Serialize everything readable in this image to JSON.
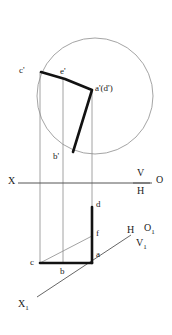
{
  "drawing": {
    "title": "Descriptive geometry projection",
    "colors": {
      "thick_line": "#121212",
      "thin_line": "#8c8c8c",
      "circle": "#9a9a9a",
      "axis": "#555555",
      "text": "#1a1a1a",
      "background": "#ffffff"
    },
    "circle": {
      "cx": 95,
      "cy": 96,
      "r": 58
    },
    "ground_line": {
      "y": 183,
      "x_start": 18,
      "x_end": 152
    },
    "front_view": {
      "polyline": "c'-e'-a'(d')-b'",
      "vertices": [
        {
          "name": "c-prime",
          "x": 41,
          "y": 72
        },
        {
          "name": "e-prime",
          "x": 65,
          "y": 79
        },
        {
          "name": "a-prime-d-prime",
          "x": 92,
          "y": 90
        },
        {
          "name": "b-prime",
          "x": 73,
          "y": 152
        }
      ]
    },
    "top_view": {
      "vertices": [
        {
          "name": "c",
          "x": 40,
          "y": 263
        },
        {
          "name": "b",
          "x": 63,
          "y": 263
        },
        {
          "name": "a",
          "x": 92,
          "y": 263
        },
        {
          "name": "f",
          "x": 92,
          "y": 236
        },
        {
          "name": "d",
          "x": 92,
          "y": 207
        }
      ]
    },
    "auxiliary_axis": {
      "x1": 37,
      "y1": 297,
      "x2": 131,
      "y2": 235
    },
    "projector_lines": [
      {
        "x": 40,
        "y_top": 72,
        "y_bottom": 263
      },
      {
        "x": 63,
        "y_top": 79,
        "y_bottom": 263
      },
      {
        "x": 92,
        "y_top": 90,
        "y_bottom": 263
      }
    ],
    "labels": {
      "c_prime": "c'",
      "e_prime": "e'",
      "a_prime_d_prime": "a'(d')",
      "b_prime": "b'",
      "x_axis": "X",
      "v_plane": "V",
      "h_plane": "H",
      "origin": "O",
      "d": "d",
      "f": "f",
      "a": "a",
      "c": "c",
      "b": "b",
      "h_aux": "H",
      "o_aux_base": "O",
      "o_aux_sub": "1",
      "v_aux_base": "V",
      "v_aux_sub": "1",
      "x_aux_base": "X",
      "x_aux_sub": "1"
    }
  }
}
